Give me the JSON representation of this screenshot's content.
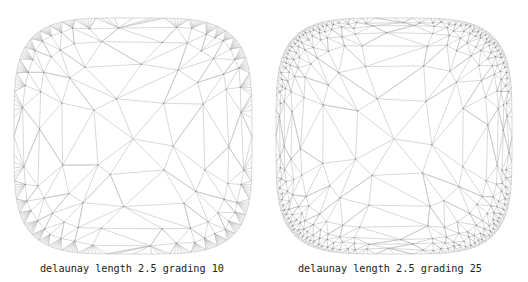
{
  "figure": {
    "line_color": "#bdbdbd",
    "node_color": "#8a8a8a",
    "panels": [
      {
        "caption": "delaunay length 2.5 grading 10",
        "method": "delaunay",
        "length": 2.5,
        "grading": 10,
        "shape": {
          "cx": 133,
          "cy": 136,
          "rx": 119,
          "ry": 118,
          "exponent": 4
        },
        "rings": [
          {
            "scale": 1.0,
            "count": 260,
            "role": "boundary"
          },
          {
            "scale": 0.92,
            "count": 42
          },
          {
            "scale": 0.8,
            "count": 26
          },
          {
            "scale": 0.6,
            "count": 14
          },
          {
            "scale": 0.33,
            "count": 7
          }
        ]
      },
      {
        "caption": "delaunay length 2.5 grading 25",
        "method": "delaunay",
        "length": 2.5,
        "grading": 25,
        "shape": {
          "cx": 394,
          "cy": 136,
          "rx": 118,
          "ry": 118,
          "exponent": 4
        },
        "rings": [
          {
            "scale": 1.0,
            "count": 260,
            "role": "boundary"
          },
          {
            "scale": 0.965,
            "count": 110
          },
          {
            "scale": 0.925,
            "count": 70
          },
          {
            "scale": 0.87,
            "count": 46
          },
          {
            "scale": 0.78,
            "count": 30
          },
          {
            "scale": 0.6,
            "count": 16
          },
          {
            "scale": 0.33,
            "count": 7
          }
        ]
      }
    ]
  }
}
